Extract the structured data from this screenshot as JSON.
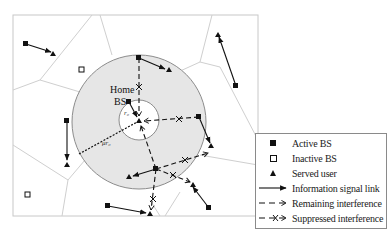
{
  "diagram": {
    "labels": {
      "home": "Home",
      "bs": "BS",
      "r0": "r₀",
      "mu_r0": "μr₀"
    },
    "colors": {
      "frame": "#c8c8c8",
      "voronoi": "#cfcfcf",
      "outer_disk_fill": "#e6e6e6",
      "circle_stroke": "#8c8c8c",
      "ink": "#111111"
    }
  },
  "legend": {
    "items": [
      {
        "symbol": "filled-square",
        "label": "Active BS"
      },
      {
        "symbol": "hollow-square",
        "label": "Inactive BS"
      },
      {
        "symbol": "filled-triangle",
        "label": "Served user"
      },
      {
        "symbol": "solid-arrow",
        "label": "Information signal link"
      },
      {
        "symbol": "dashed-arrow",
        "label": "Remaining interference"
      },
      {
        "symbol": "dashed-arrow-crossed",
        "label": "Suppressed interference"
      }
    ]
  }
}
